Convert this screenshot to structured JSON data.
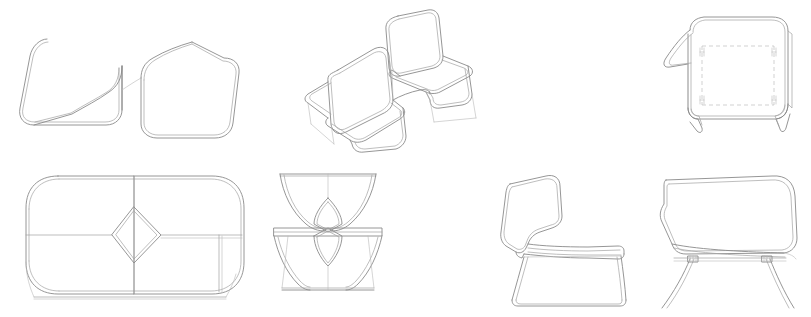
{
  "drawing": {
    "title": "Furniture Technical Drawing Sheet",
    "subject": "Two-seat back-to-back lounge chair / bench",
    "background_color": "#ffffff",
    "line_color": "#8a8a8a",
    "hidden_line_color": "#bdbdbd",
    "faint_line_color": "#b9b9b9",
    "line_weight_px": 0.9,
    "sheet_width_px": 811,
    "sheet_height_px": 317,
    "text_present": "none",
    "dimensions_present": "none",
    "views": [
      {
        "id": "view-top-linked-pair",
        "name": "top-plan-linked-pair",
        "label": "",
        "row": 1,
        "column": 1,
        "projection": "plan",
        "description": "Plan outline of two rounded square seat shells joined by an S-shaped linking curve",
        "x": 18,
        "y": 34,
        "width": 218,
        "height": 95,
        "line_style": "solid"
      },
      {
        "id": "view-perspective",
        "name": "perspective-two-seat-bench",
        "label": "",
        "row": 1,
        "column": 2,
        "projection": "axonometric",
        "description": "Three-quarter perspective of the back-to-back two-seat bench with sled base",
        "x": 306,
        "y": 8,
        "width": 162,
        "height": 143,
        "line_style": "solid"
      },
      {
        "id": "view-rear-elevation",
        "name": "rear-elevation-hidden-lines",
        "label": "",
        "row": 1,
        "column": 3,
        "projection": "rear-elevation",
        "description": "Rear elevation with dashed hidden lines indicating the inner seat panel and fixing brackets",
        "x": 660,
        "y": 14,
        "width": 132,
        "height": 116,
        "line_style": "solid-with-hidden-dashed"
      },
      {
        "id": "view-plan",
        "name": "plan-view-full-bench",
        "label": "",
        "row": 2,
        "column": 1,
        "projection": "plan",
        "description": "Full plan view of the bench showing the central diamond-shaped joining panel",
        "x": 22,
        "y": 172,
        "width": 228,
        "height": 124,
        "line_style": "solid"
      },
      {
        "id": "view-front-elevation",
        "name": "front-end-elevation",
        "label": "",
        "row": 2,
        "column": 2,
        "projection": "end-elevation",
        "description": "End elevation showing the hourglass silhouette and the pair of leaf-shaped openings",
        "x": 272,
        "y": 170,
        "width": 108,
        "height": 122,
        "line_style": "solid"
      },
      {
        "id": "view-side-elevation",
        "name": "side-elevation-single-chair",
        "label": "",
        "row": 2,
        "column": 3,
        "projection": "side-elevation",
        "description": "Side elevation of a single chair with high back and tapered sled leg frame",
        "x": 495,
        "y": 172,
        "width": 140,
        "height": 125,
        "line_style": "solid"
      },
      {
        "id": "view-front-seat",
        "name": "front-elevation-seat-shell",
        "label": "",
        "row": 2,
        "column": 4,
        "projection": "front-elevation",
        "description": "Front elevation of the seat shell above the splayed double-rod leg frame",
        "x": 648,
        "y": 172,
        "width": 152,
        "height": 126,
        "line_style": "solid"
      }
    ]
  }
}
